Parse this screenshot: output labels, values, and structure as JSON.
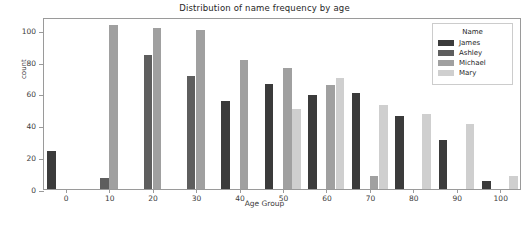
{
  "chart_data": {
    "type": "bar",
    "title": "Distribution of name frequency by age",
    "xlabel": "Age Group",
    "ylabel": "count",
    "categories": [
      "0",
      "10",
      "20",
      "30",
      "40",
      "50",
      "60",
      "70",
      "80",
      "90",
      "100"
    ],
    "xticks": [
      "0",
      "10",
      "20",
      "30",
      "40",
      "50",
      "60",
      "70",
      "80",
      "90",
      "100"
    ],
    "yticks": [
      "0",
      "20",
      "40",
      "60",
      "80",
      "100"
    ],
    "ylim": [
      0,
      108
    ],
    "grid": false,
    "legend": {
      "title": "Name",
      "position": "upper right",
      "entries": [
        "James",
        "Ashley",
        "Michael",
        "Mary"
      ]
    },
    "colors": {
      "James": "#3b3b3b",
      "Ashley": "#5e5e5e",
      "Michael": "#a0a0a0",
      "Mary": "#cfcfcf"
    },
    "series": [
      {
        "name": "James",
        "color": "#3b3b3b",
        "values": [
          24,
          null,
          null,
          null,
          55,
          66,
          59,
          60,
          46,
          31,
          5
        ]
      },
      {
        "name": "Ashley",
        "color": "#5e5e5e",
        "values": [
          null,
          7,
          84,
          71,
          null,
          null,
          null,
          null,
          null,
          null,
          null
        ]
      },
      {
        "name": "Michael",
        "color": "#a0a0a0",
        "values": [
          null,
          103,
          101,
          100,
          81,
          76,
          65,
          8,
          null,
          null,
          null
        ]
      },
      {
        "name": "Mary",
        "color": "#cfcfcf",
        "values": [
          null,
          null,
          null,
          null,
          null,
          50,
          70,
          53,
          47,
          41,
          8
        ]
      }
    ]
  }
}
